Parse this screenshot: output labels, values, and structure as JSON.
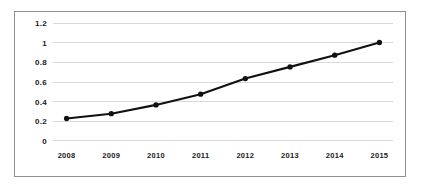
{
  "chart_data": {
    "type": "line",
    "title": "",
    "subtitle": "",
    "xlabel": "",
    "ylabel": "",
    "categories": [
      "2008",
      "2009",
      "2010",
      "2011",
      "2012",
      "2013",
      "2014",
      "2015"
    ],
    "values": [
      0.22,
      0.27,
      0.36,
      0.47,
      0.63,
      0.75,
      0.87,
      1.0
    ],
    "series": [
      {
        "name": "",
        "values": [
          0.22,
          0.27,
          0.36,
          0.47,
          0.63,
          0.75,
          0.87,
          1.0
        ]
      }
    ],
    "ylim": [
      0,
      1.2
    ],
    "yticks": [
      0,
      0.2,
      0.4,
      0.6,
      0.8,
      1,
      1.2
    ],
    "ytick_labels": [
      "0",
      "0.2",
      "0.4",
      "0.6",
      "0.8",
      "1",
      "1.2"
    ],
    "xtick_labels": [
      "2008",
      "2009",
      "2010",
      "2011",
      "2012",
      "2013",
      "2014",
      "2015"
    ],
    "grid": true,
    "grid_axis": "y",
    "legend": false,
    "legend_position": "none",
    "marker": "circle",
    "line_color": "#111111",
    "marker_color": "#111111",
    "grid_color": "#d9d9d9",
    "border_color": "#8f8f8f",
    "background_color": "#ffffff",
    "annotations": []
  }
}
